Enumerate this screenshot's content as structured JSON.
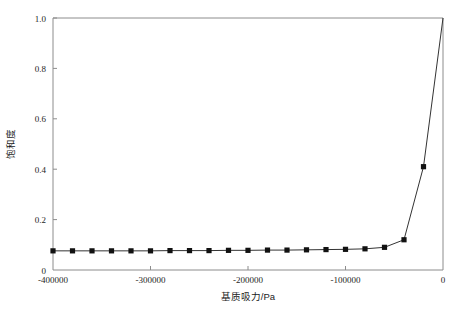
{
  "chart_data": {
    "type": "line",
    "title": "",
    "xlabel": "基质吸力/Pa",
    "ylabel": "饱和度",
    "xlim": [
      -400000,
      0
    ],
    "ylim": [
      0,
      1.0
    ],
    "grid": false,
    "legend": null,
    "xticks": [
      -400000,
      -300000,
      -200000,
      -100000,
      0
    ],
    "xtick_labels": [
      "-400000",
      "-300000",
      "-200000",
      "-100000",
      "0"
    ],
    "yticks": [
      0,
      0.2,
      0.4,
      0.6,
      0.8,
      1.0
    ],
    "ytick_labels": [
      "0",
      "0.2",
      "0.4",
      "0.6",
      "0.8",
      "1.0"
    ],
    "marker": "square",
    "marker_color": "#111111",
    "line_color": "#333333",
    "series": [
      {
        "name": "soil-water characteristic curve",
        "x": [
          -400000,
          -380000,
          -360000,
          -340000,
          -320000,
          -300000,
          -280000,
          -260000,
          -240000,
          -220000,
          -200000,
          -180000,
          -160000,
          -140000,
          -120000,
          -100000,
          -80000,
          -60000,
          -40000,
          -20000,
          0
        ],
        "y": [
          0.076,
          0.076,
          0.076,
          0.076,
          0.076,
          0.076,
          0.077,
          0.077,
          0.077,
          0.078,
          0.078,
          0.079,
          0.079,
          0.08,
          0.081,
          0.082,
          0.084,
          0.09,
          0.12,
          0.41,
          1.0
        ]
      }
    ]
  },
  "axes": {
    "ylabel_chars": "饱和度"
  }
}
